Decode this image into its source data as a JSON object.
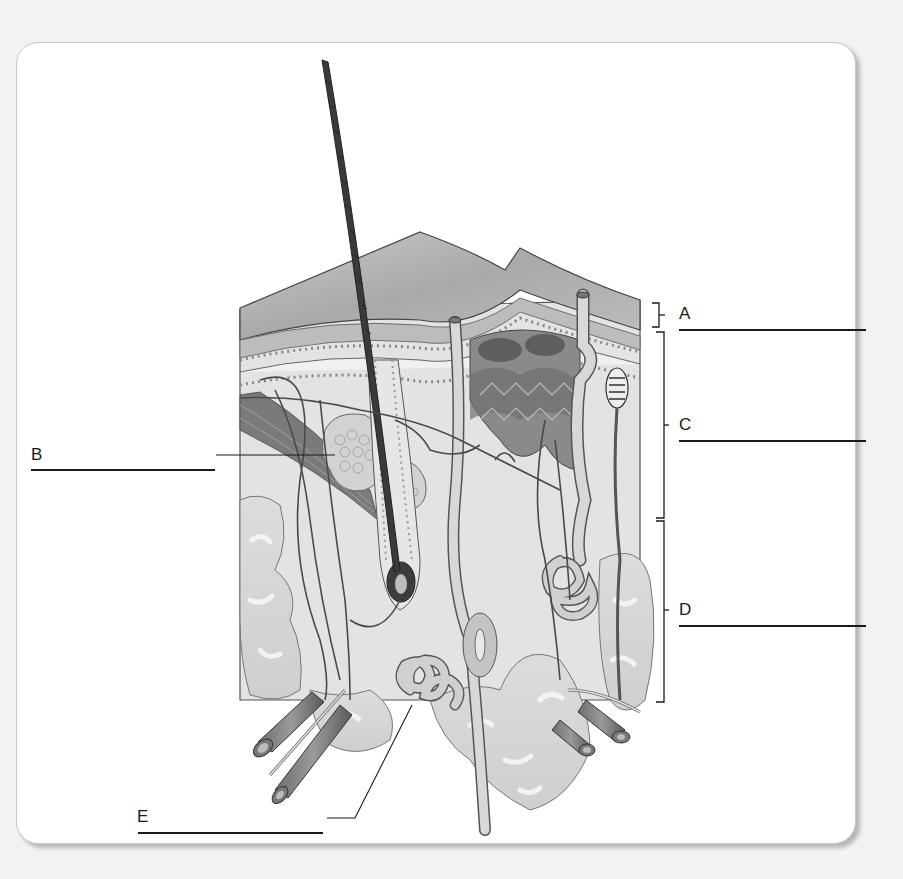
{
  "figure": {
    "structures": [
      "hair shaft",
      "epidermis",
      "dermis",
      "hypodermis",
      "sebaceous gland",
      "arrector pili muscle",
      "hair follicle",
      "sweat gland",
      "blood vessels",
      "adipose tissue",
      "nerve"
    ]
  },
  "labels": {
    "A": {
      "letter": "A",
      "answer": ""
    },
    "B": {
      "letter": "B",
      "answer": ""
    },
    "C": {
      "letter": "C",
      "answer": ""
    },
    "D": {
      "letter": "D",
      "answer": ""
    },
    "E": {
      "letter": "E",
      "answer": ""
    }
  },
  "colors": {
    "background": "#f2f2f2",
    "panel": "#ffffff",
    "ink": "#1a1a1a",
    "tissue_light": "#d9d9d9",
    "tissue_mid": "#a8a8a8",
    "tissue_dark": "#555555",
    "hair": "#3a3a3a"
  }
}
